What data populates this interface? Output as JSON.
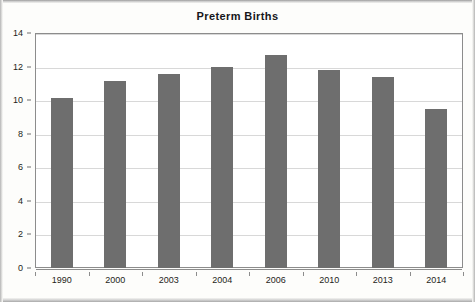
{
  "chart_data": {
    "type": "bar",
    "title": "Preterm Births",
    "xlabel": "",
    "ylabel": "",
    "categories": [
      "1990",
      "2000",
      "2003",
      "2004",
      "2006",
      "2010",
      "2013",
      "2014"
    ],
    "values": [
      10.15,
      11.15,
      11.55,
      11.95,
      12.7,
      11.8,
      11.35,
      9.5
    ],
    "ylim": [
      0,
      14
    ],
    "ytick_labels": [
      "0",
      "2",
      "4",
      "6",
      "8",
      "10",
      "12",
      "14"
    ],
    "ytick_values": [
      0,
      2,
      4,
      6,
      8,
      10,
      12,
      14
    ],
    "grid": true,
    "legend": false,
    "legend_position": "none",
    "bar_color": "#6e6e6e",
    "gridline_color": "#d8d8d8",
    "axis_color": "#8c8c8c",
    "plot_background": "#ffffff"
  }
}
